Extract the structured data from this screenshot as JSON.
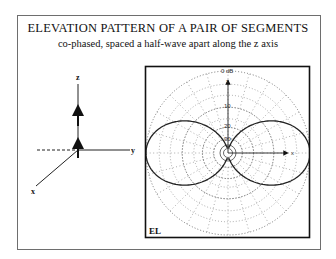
{
  "header": {
    "title": "ELEVATION PATTERN OF A PAIR OF SEGMENTS",
    "subtitle": "co-phased, spaced a half-wave apart along the z axis"
  },
  "axes_diagram": {
    "labels": {
      "z": "z",
      "y": "y",
      "x": "x"
    },
    "segments": 2,
    "segment_orientation": "z",
    "spacing_wavelengths": 0.5,
    "phase": "co-phased"
  },
  "polar_plot": {
    "plane_label": "EL",
    "reference_label": "0 dB",
    "ring_labels": [
      "10",
      "20",
      "30"
    ],
    "axis_labels": {
      "vertical": "z",
      "horizontal": "x"
    }
  },
  "chart_data": {
    "type": "polar",
    "title": "ELEVATION PATTERN OF A PAIR OF SEGMENTS",
    "subtitle": "co-phased, spaced a half-wave apart along the z axis",
    "plane": "EL",
    "radial_scale": "dB",
    "radial_ticks_db": [
      0,
      -10,
      -20,
      -30
    ],
    "radial_tick_labels": [
      "0 dB",
      "10",
      "20",
      "30"
    ],
    "angular_grid_step_deg": 15,
    "grid": true,
    "series": [
      {
        "name": "pattern",
        "description": "Two co-phased z-directed dipoles spaced 0.5 wavelength along z; broadside lobes along ±x, nulls along ±z",
        "max_direction": "±x (90° from z)",
        "null_direction": "±z",
        "peak_db": 0
      }
    ]
  }
}
